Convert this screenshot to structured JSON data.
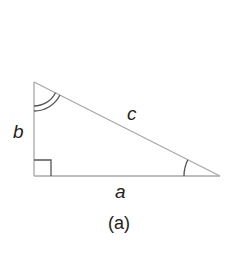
{
  "diagram": {
    "type": "right-triangle",
    "vertices": {
      "top": [
        34,
        82
      ],
      "right_angle": [
        34,
        176
      ],
      "right": [
        220,
        176
      ]
    },
    "stroke_color": "#a8a8a8",
    "mark_color": "#555555",
    "labels": {
      "side_a": "a",
      "side_b": "b",
      "side_c": "c"
    },
    "angle_marks": {
      "right_angle": "square",
      "top_angle": "double-arc",
      "right_vertex_angle": "single-arc"
    },
    "caption": "(a)"
  }
}
